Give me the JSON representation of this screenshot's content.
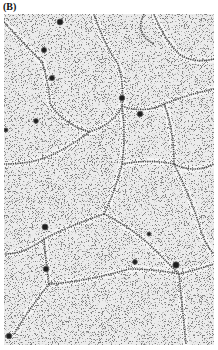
{
  "figure": {
    "panel_label": "(B)",
    "image_description": "Grayscale micrograph showing a polygonal network of dark beaded filaments with dark spherical nodes on a speckled background",
    "colors": {
      "background": "#e9e9e9",
      "speckle": "#3a3a3a",
      "filament": "#4a4a4a",
      "node": "#1e1e1e"
    }
  }
}
